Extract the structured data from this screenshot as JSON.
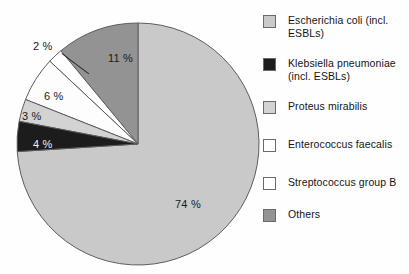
{
  "chart_data": {
    "type": "pie",
    "title": "",
    "subtitle": "",
    "xlabel": "",
    "ylabel": "",
    "grid": false,
    "legend_position": "right",
    "unit": "%",
    "start_angle_deg": 90,
    "direction": "clockwise",
    "categories": [
      "Escherichia coli (incl. ESBLs)",
      "Klebsiella pneumoniae (incl. ESBLs)",
      "Proteus mirabilis",
      "Enterococcus faecalis",
      "Streptococcus group B",
      "Others"
    ],
    "values": [
      74,
      4,
      3,
      6,
      2,
      11
    ],
    "value_labels": [
      "74 %",
      "4 %",
      "3 %",
      "6 %",
      "2 %",
      "11 %"
    ],
    "colors": [
      "#c9c9c9",
      "#1c1c1c",
      "#d3d3d3",
      "#fdfdfd",
      "#ffffff",
      "#939393"
    ],
    "slices": [
      {
        "name": "Escherichia coli (incl. ESBLs)",
        "value": 74,
        "label": "74 %",
        "color": "#c9c9c9",
        "start_pct": 0,
        "end_pct": 74
      },
      {
        "name": "Others",
        "value": 11,
        "label": "11 %",
        "color": "#939393",
        "start_pct": 89,
        "end_pct": 100
      },
      {
        "name": "Streptococcus group B",
        "value": 2,
        "label": "2 %",
        "color": "#ffffff",
        "start_pct": 87,
        "end_pct": 89
      },
      {
        "name": "Enterococcus faecalis",
        "value": 6,
        "label": "6 %",
        "color": "#fdfdfd",
        "start_pct": 81,
        "end_pct": 87
      },
      {
        "name": "Proteus mirabilis",
        "value": 3,
        "label": "3 %",
        "color": "#d3d3d3",
        "start_pct": 78,
        "end_pct": 81
      },
      {
        "name": "Klebsiella pneumoniae (incl. ESBLs)",
        "value": 4,
        "label": "4 %",
        "color": "#1c1c1c",
        "start_pct": 74,
        "end_pct": 78
      }
    ]
  },
  "pie": {
    "labels": {
      "ecoli": "74 %",
      "klebsiella": "4 %",
      "proteus": "3 %",
      "enterococcus": "6 %",
      "streptococcus": "2 %",
      "others": "11 %"
    }
  },
  "legend": {
    "items": [
      {
        "line1": "Escherichia coli (incl.",
        "line2": "ESBLs)",
        "color": "#c9c9c9"
      },
      {
        "line1": "Klebsiella pneumoniae",
        "line2": "(incl. ESBLs)",
        "color": "#1c1c1c"
      },
      {
        "line1": "Proteus mirabilis",
        "line2": "",
        "color": "#d3d3d3"
      },
      {
        "line1": "Enterococcus faecalis",
        "line2": "",
        "color": "#fdfdfd"
      },
      {
        "line1": "Streptococcus group B",
        "line2": "",
        "color": "#ffffff"
      },
      {
        "line1": "Others",
        "line2": "",
        "color": "#939393"
      }
    ]
  }
}
